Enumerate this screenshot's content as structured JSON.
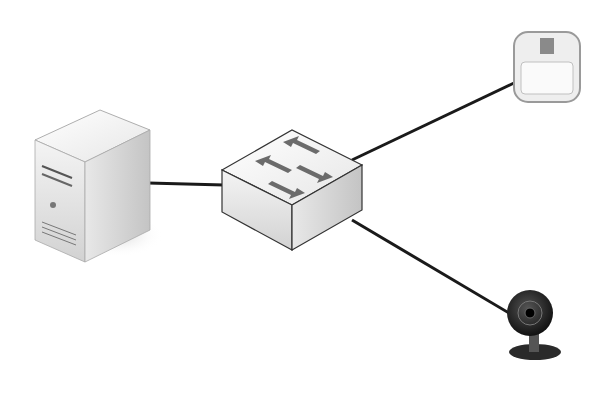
{
  "diagram": {
    "type": "network-topology",
    "nodes": [
      {
        "id": "server",
        "kind": "tower-server",
        "x": 90,
        "y": 185
      },
      {
        "id": "switch",
        "kind": "network-switch",
        "x": 293,
        "y": 190
      },
      {
        "id": "sensor",
        "kind": "motion-sensor",
        "x": 545,
        "y": 65
      },
      {
        "id": "camera",
        "kind": "ip-camera",
        "x": 530,
        "y": 325
      }
    ],
    "edges": [
      {
        "from": "server",
        "to": "switch"
      },
      {
        "from": "switch",
        "to": "sensor"
      },
      {
        "from": "switch",
        "to": "camera"
      }
    ],
    "colors": {
      "link": "#1a1a1a",
      "device_light": "#f2f2f2",
      "device_mid": "#cfcfcf",
      "device_dark": "#1c1c1c",
      "arrow": "#6b6b6b"
    }
  }
}
